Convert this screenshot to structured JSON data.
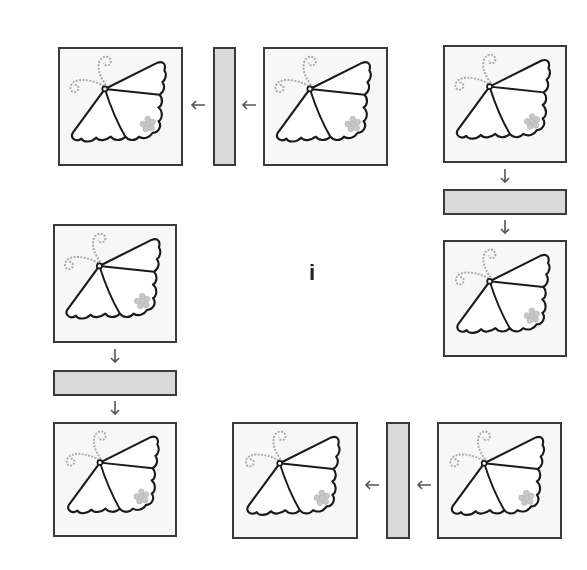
{
  "figure": {
    "center_label": "i",
    "colors": {
      "tile_border": "#3a3a3a",
      "tile_fill": "#f7f7f7",
      "bar_fill": "#d9d9d9",
      "butterfly_stroke": "#1a1a1a",
      "antenna_stroke": "#a8a8a8",
      "flower_fill": "#c8c8c8",
      "arrow": "#555555"
    },
    "icons": {
      "tile": "butterfly-icon",
      "arrow": "arrow-icon"
    },
    "groups": [
      {
        "name": "top-left",
        "direction": "left",
        "tiles": [
          "source",
          "reflected"
        ],
        "bar": "vertical-mirror"
      },
      {
        "name": "right",
        "direction": "down",
        "tiles": [
          "source",
          "reflected"
        ],
        "bar": "horizontal-mirror"
      },
      {
        "name": "left",
        "direction": "down",
        "tiles": [
          "source",
          "reflected"
        ],
        "bar": "horizontal-mirror"
      },
      {
        "name": "bottom",
        "direction": "left",
        "tiles": [
          "source",
          "reflected"
        ],
        "bar": "vertical-mirror"
      }
    ]
  }
}
